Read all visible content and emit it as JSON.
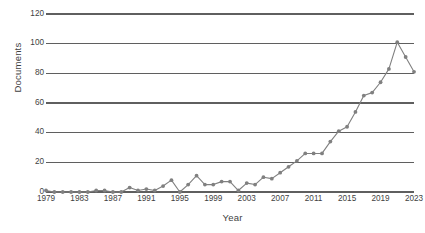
{
  "chart_data": {
    "type": "line",
    "title": "",
    "xlabel": "Year",
    "ylabel": "Documents",
    "xlim": [
      1979,
      2023
    ],
    "ylim": [
      0,
      120
    ],
    "grid": true,
    "legend": false,
    "marker": "circle",
    "series_color": "#808080",
    "gridline_color": "#5f5f5f",
    "x": [
      1979,
      1980,
      1981,
      1982,
      1983,
      1984,
      1985,
      1986,
      1987,
      1988,
      1989,
      1990,
      1991,
      1992,
      1993,
      1994,
      1995,
      1996,
      1997,
      1998,
      1999,
      2000,
      2001,
      2002,
      2003,
      2004,
      2005,
      2006,
      2007,
      2008,
      2009,
      2010,
      2011,
      2012,
      2013,
      2014,
      2015,
      2016,
      2017,
      2018,
      2019,
      2020,
      2021,
      2022,
      2023
    ],
    "values": [
      1,
      0,
      0,
      0,
      0,
      0,
      1,
      1,
      0,
      0,
      3,
      1,
      2,
      1,
      4,
      8,
      0,
      5,
      11,
      5,
      5,
      7,
      7,
      1,
      6,
      5,
      10,
      9,
      13,
      17,
      21,
      26,
      26,
      26,
      34,
      41,
      44,
      54,
      65,
      67,
      74,
      83,
      101,
      91,
      81
    ],
    "y_ticks": [
      0,
      20,
      40,
      60,
      80,
      100,
      120
    ],
    "x_ticks": [
      1979,
      1983,
      1987,
      1991,
      1995,
      1999,
      2003,
      2007,
      2011,
      2015,
      2019,
      2023
    ],
    "y_tick_labels": [
      "0",
      "20",
      "40",
      "60",
      "80",
      "100",
      "120"
    ],
    "x_tick_labels": [
      "1979",
      "1983",
      "1987",
      "1991",
      "1995",
      "1999",
      "2003",
      "2007",
      "2011",
      "2015",
      "2019",
      "2023"
    ]
  }
}
